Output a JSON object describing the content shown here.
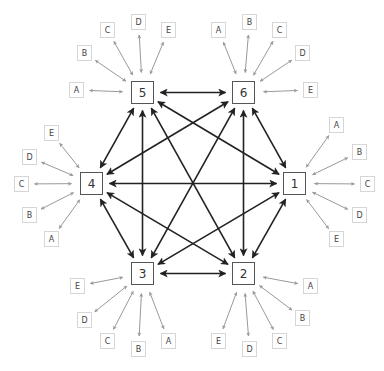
{
  "colors": {
    "main_edge": "#222222",
    "leaf_edge": "#999999",
    "node_border": "#555555",
    "leaf_border": "#d6d6d6"
  },
  "nodes": [
    {
      "id": "1",
      "label": "1",
      "x": 283,
      "y": 172
    },
    {
      "id": "2",
      "label": "2",
      "x": 232,
      "y": 262
    },
    {
      "id": "3",
      "label": "3",
      "x": 131,
      "y": 262
    },
    {
      "id": "4",
      "label": "4",
      "x": 80,
      "y": 172
    },
    {
      "id": "5",
      "label": "5",
      "x": 131,
      "y": 81
    },
    {
      "id": "6",
      "label": "6",
      "x": 232,
      "y": 81
    }
  ],
  "edges_note": "complete graph, all pairs bidirectional",
  "leaves": [
    {
      "node": "5",
      "label": "A",
      "x": 69,
      "y": 82
    },
    {
      "node": "5",
      "label": "B",
      "x": 77,
      "y": 45
    },
    {
      "node": "5",
      "label": "C",
      "x": 100,
      "y": 22
    },
    {
      "node": "5",
      "label": "D",
      "x": 131,
      "y": 14
    },
    {
      "node": "5",
      "label": "E",
      "x": 161,
      "y": 22
    },
    {
      "node": "6",
      "label": "A",
      "x": 211,
      "y": 22
    },
    {
      "node": "6",
      "label": "B",
      "x": 242,
      "y": 14
    },
    {
      "node": "6",
      "label": "C",
      "x": 272,
      "y": 22
    },
    {
      "node": "6",
      "label": "D",
      "x": 295,
      "y": 45
    },
    {
      "node": "6",
      "label": "E",
      "x": 303,
      "y": 82
    },
    {
      "node": "1",
      "label": "A",
      "x": 329,
      "y": 117
    },
    {
      "node": "1",
      "label": "B",
      "x": 352,
      "y": 144
    },
    {
      "node": "1",
      "label": "C",
      "x": 360,
      "y": 176
    },
    {
      "node": "1",
      "label": "D",
      "x": 352,
      "y": 207
    },
    {
      "node": "1",
      "label": "E",
      "x": 329,
      "y": 231
    },
    {
      "node": "4",
      "label": "E",
      "x": 44,
      "y": 125
    },
    {
      "node": "4",
      "label": "D",
      "x": 22,
      "y": 149
    },
    {
      "node": "4",
      "label": "C",
      "x": 14,
      "y": 176
    },
    {
      "node": "4",
      "label": "B",
      "x": 22,
      "y": 207
    },
    {
      "node": "4",
      "label": "A",
      "x": 44,
      "y": 231
    },
    {
      "node": "3",
      "label": "E",
      "x": 70,
      "y": 278
    },
    {
      "node": "3",
      "label": "D",
      "x": 77,
      "y": 312
    },
    {
      "node": "3",
      "label": "C",
      "x": 100,
      "y": 333
    },
    {
      "node": "3",
      "label": "B",
      "x": 131,
      "y": 341
    },
    {
      "node": "3",
      "label": "A",
      "x": 161,
      "y": 333
    },
    {
      "node": "2",
      "label": "A",
      "x": 303,
      "y": 278
    },
    {
      "node": "2",
      "label": "B",
      "x": 295,
      "y": 310
    },
    {
      "node": "2",
      "label": "C",
      "x": 272,
      "y": 333
    },
    {
      "node": "2",
      "label": "D",
      "x": 242,
      "y": 341
    },
    {
      "node": "2",
      "label": "E",
      "x": 211,
      "y": 333
    }
  ]
}
